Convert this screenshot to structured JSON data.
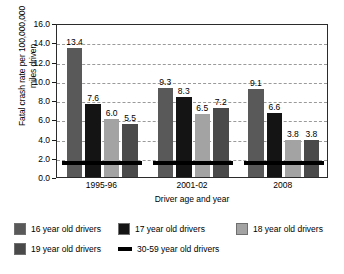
{
  "chart_data": {
    "type": "bar",
    "title": "",
    "subtitle": "",
    "xlabel": "Driver age and year",
    "ylabel": "Fatal crash rate per 100,000,000\nmiles driven",
    "categories": [
      "1995-96",
      "2001-02",
      "2008"
    ],
    "ylim": [
      0,
      16
    ],
    "ytick_step": 2,
    "ytick_labels": [
      "0.0",
      "2.0",
      "4.0",
      "6.0",
      "8.0",
      "10.0",
      "12.0",
      "14.0",
      "16.0"
    ],
    "grid": "horizontal-dashed",
    "legend_position": "bottom",
    "series": [
      {
        "name": "16 year old drivers",
        "color": "#595959",
        "marker": "square",
        "values": [
          13.4,
          9.3,
          9.1
        ],
        "labels": [
          "13.4",
          "9.3",
          "9.1"
        ]
      },
      {
        "name": "17 year old drivers",
        "color": "#141414",
        "marker": "square",
        "values": [
          7.6,
          8.3,
          6.6
        ],
        "labels": [
          "7.6",
          "8.3",
          "6.6"
        ]
      },
      {
        "name": "18 year old drivers",
        "color": "#a3a3a3",
        "marker": "square",
        "values": [
          6.0,
          6.5,
          3.8
        ],
        "labels": [
          "6.0",
          "6.5",
          "3.8"
        ]
      },
      {
        "name": "19 year old drivers",
        "color": "#4a4a4a",
        "marker": "square",
        "values": [
          5.5,
          7.2,
          3.8
        ],
        "labels": [
          "5.5",
          "7.2",
          "3.8"
        ]
      },
      {
        "name": "30-59 year old drivers",
        "color": "#000000",
        "marker": "line",
        "values": [
          1.5,
          1.5,
          1.5
        ],
        "labels": [
          "",
          "",
          ""
        ]
      }
    ]
  },
  "legend": {
    "row1": [
      {
        "label": "16 year old drivers",
        "color": "#595959",
        "marker": "square"
      },
      {
        "label": "17 year old drivers",
        "color": "#141414",
        "marker": "square"
      },
      {
        "label": "18 year old drivers",
        "color": "#a3a3a3",
        "marker": "square"
      }
    ],
    "row2": [
      {
        "label": "19 year old drivers",
        "color": "#4a4a4a",
        "marker": "square"
      },
      {
        "label": "30-59 year old drivers",
        "color": "#000000",
        "marker": "line"
      }
    ]
  }
}
